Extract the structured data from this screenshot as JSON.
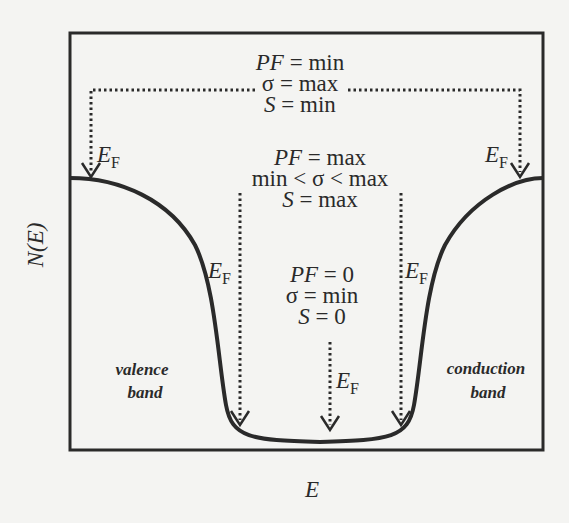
{
  "axes": {
    "ylabel_main": "N",
    "ylabel_arg": "(E)",
    "xlabel": "E"
  },
  "top_group": {
    "pf": "PF",
    "pf_value": " = min",
    "sigma": "σ = max",
    "s": "S",
    "s_value": " = min"
  },
  "middle_group": {
    "pf": "PF",
    "pf_value": " = max",
    "sigma": "min < σ < max",
    "s": "S",
    "s_value": " = max"
  },
  "bottom_group": {
    "pf": "PF",
    "pf_value": " = 0",
    "sigma": "σ = min",
    "s": "S",
    "s_value": " = 0"
  },
  "fermi": {
    "symbol": "E",
    "subscript": "F"
  },
  "bands": {
    "valence_line1": "valence",
    "valence_line2": "band",
    "conduction_line1": "conduction",
    "conduction_line2": "band"
  },
  "colors": {
    "ink": "#2a2a2a",
    "background": "#f4f4f2"
  }
}
